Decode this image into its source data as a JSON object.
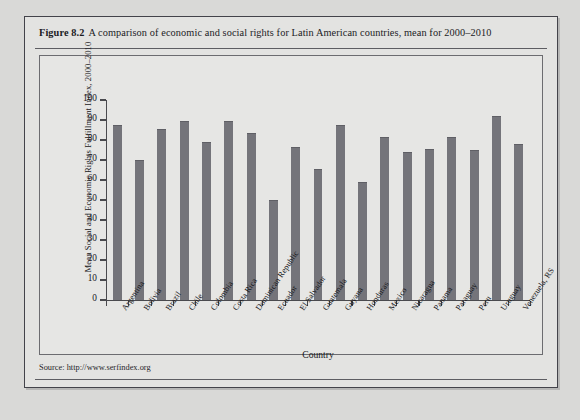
{
  "figure": {
    "number": "Figure 8.2",
    "caption": "A comparison of economic and social rights for Latin American countries, mean for 2000–2010",
    "source": "Source: http://www.serfindex.org",
    "bar_color": "#74747a",
    "panel_color": "#e3e3e1",
    "axis_color": "#4a4a4e"
  },
  "chart_data": {
    "type": "bar",
    "title": "A comparison of economic and social rights for Latin American countries, mean for 2000–2010",
    "xlabel": "Country",
    "ylabel": "Mean Social and Economic Rights Fulfillment Index, 2000–2010",
    "ylim": [
      0,
      100
    ],
    "yticks": [
      0,
      10,
      20,
      30,
      40,
      50,
      60,
      70,
      80,
      90,
      100
    ],
    "grid": false,
    "legend": null,
    "categories": [
      "Argentina",
      "Bolivia",
      "Brazil",
      "Chile",
      "Colombia",
      "Costa Rica",
      "Dominican Republic",
      "Ecuador",
      "El Salvador",
      "Guatemala",
      "Guyana",
      "Honduras",
      "Mexico",
      "Nicaragua",
      "Panama",
      "Paraguay",
      "Peru",
      "Uruguay",
      "Venezuela, RS"
    ],
    "values": [
      87.5,
      70.0,
      85.5,
      89.5,
      79.0,
      89.5,
      83.5,
      50.0,
      76.5,
      65.5,
      87.5,
      59.0,
      81.5,
      74.0,
      75.5,
      81.5,
      75.0,
      92.0,
      78.0
    ]
  }
}
